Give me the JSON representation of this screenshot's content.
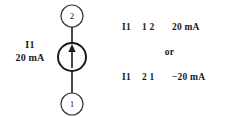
{
  "figure": {
    "background_color": "#ffffff",
    "ink_color": "#1a1a1a"
  },
  "circuit": {
    "source_label": {
      "name": "I1",
      "value": "20 mA"
    },
    "nodes": {
      "top": "2",
      "bottom": "1"
    },
    "symbol": {
      "type": "current-source",
      "arrow_direction": "up"
    }
  },
  "netlist": {
    "line_1": {
      "device": "I1",
      "nodes": "1 2",
      "value": "20 mA"
    },
    "separator": "or",
    "line_2": {
      "device": "I1",
      "nodes": "2 1",
      "value": "−20 mA"
    }
  }
}
